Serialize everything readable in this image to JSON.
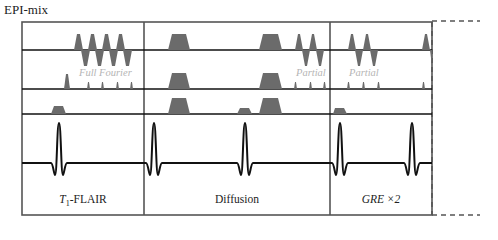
{
  "title": "EPI-mix",
  "annotations": {
    "full_fourier": "Full Fourier",
    "partial_1": "Partial",
    "partial_2": "Partial"
  },
  "modules": [
    {
      "label_prefix": "T",
      "label_sub": "1",
      "label_suffix": "-FLAIR"
    },
    {
      "label": "Diffusion"
    },
    {
      "label": "GRE ×2"
    }
  ],
  "colors": {
    "line": "#111111",
    "box": "#555555",
    "pulse_fill": "#6b6b6b",
    "annotation": "#b5b5b5"
  }
}
